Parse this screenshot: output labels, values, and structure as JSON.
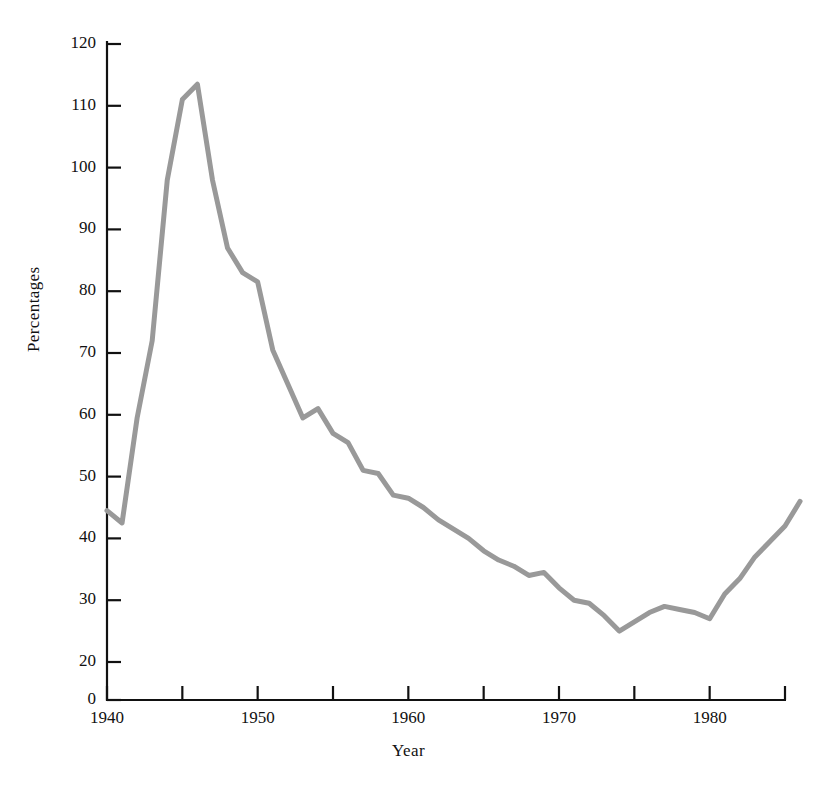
{
  "chart_data": {
    "type": "line",
    "title": "",
    "xlabel": "Year",
    "ylabel": "Percentages",
    "grid": false,
    "legend": null,
    "line_color": "#999999",
    "axis_color": "#111111",
    "xlim": [
      1940,
      1985
    ],
    "ylim": [
      20,
      120
    ],
    "y_axis_break": true,
    "y_axis_break_note": "axis shows 0 below 20 with a compressed break",
    "yticks": [
      0,
      20,
      30,
      40,
      50,
      60,
      70,
      80,
      90,
      100,
      110,
      120
    ],
    "ytick_labels": [
      "0",
      "20",
      "30",
      "40",
      "50",
      "60",
      "70",
      "80",
      "90",
      "100",
      "110",
      "120"
    ],
    "xticks": [
      1940,
      1945,
      1950,
      1955,
      1960,
      1965,
      1970,
      1975,
      1980,
      1985
    ],
    "xtick_labels": [
      "1940",
      "",
      "1950",
      "",
      "1960",
      "",
      "1970",
      "",
      "1980",
      ""
    ],
    "xtick_labels_shown": [
      "1940",
      "1950",
      "1960",
      "1970",
      "1980"
    ],
    "series": [
      {
        "name": "Percentages",
        "x": [
          1940,
          1941,
          1942,
          1943,
          1944,
          1945,
          1946,
          1947,
          1948,
          1949,
          1950,
          1951,
          1952,
          1953,
          1954,
          1955,
          1956,
          1957,
          1958,
          1959,
          1960,
          1961,
          1962,
          1963,
          1964,
          1965,
          1966,
          1967,
          1968,
          1969,
          1970,
          1971,
          1972,
          1973,
          1974,
          1975,
          1976,
          1977,
          1978,
          1979,
          1980,
          1981,
          1982,
          1983,
          1984,
          1985,
          1986
        ],
        "values": [
          44.5,
          42.5,
          59.5,
          72.0,
          98.0,
          111.0,
          113.5,
          98.0,
          87.0,
          83.0,
          81.5,
          70.5,
          65.0,
          59.5,
          61.0,
          57.0,
          55.5,
          51.0,
          50.5,
          47.0,
          46.5,
          45.0,
          43.0,
          41.5,
          40.0,
          38.0,
          36.5,
          35.5,
          34.0,
          34.5,
          32.0,
          30.0,
          29.5,
          27.5,
          25.0,
          26.5,
          28.0,
          29.0,
          28.5,
          28.0,
          27.0,
          31.0,
          33.5,
          37.0,
          39.5,
          42.0,
          46.0
        ]
      }
    ]
  }
}
